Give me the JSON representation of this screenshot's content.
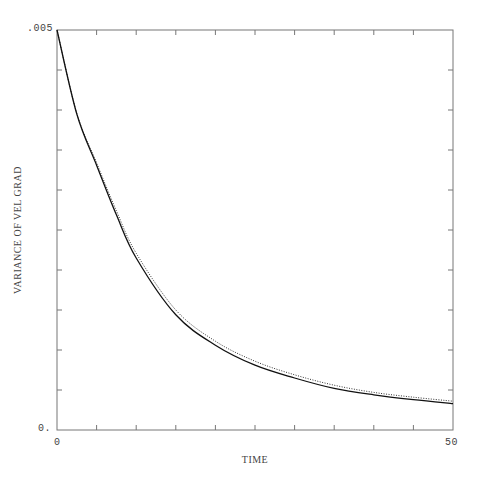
{
  "chart_data": {
    "type": "line",
    "title": "",
    "xlabel": "TIME",
    "ylabel": "VARIANCE OF VEL GRAD",
    "xlim": [
      0,
      50
    ],
    "ylim": [
      0,
      0.005
    ],
    "x_tick_labels": [
      "0",
      "50"
    ],
    "y_tick_labels": [
      ".005",
      "0."
    ],
    "x_minor_ticks": [
      5,
      10,
      15,
      20,
      25,
      30,
      35,
      40,
      45
    ],
    "y_minor_ticks": [
      0.0005,
      0.001,
      0.0015,
      0.002,
      0.0025,
      0.003,
      0.0035,
      0.004,
      0.0045
    ],
    "grid": false,
    "legend": null,
    "series": [
      {
        "name": "solid",
        "style": "solid",
        "x": [
          0,
          2.5,
          5,
          7.5,
          10,
          15,
          20,
          25,
          30,
          35,
          40,
          45,
          50
        ],
        "values": [
          0.005,
          0.00395,
          0.00331,
          0.00269,
          0.00215,
          0.00144,
          0.00106,
          0.00081,
          0.00065,
          0.00052,
          0.00044,
          0.00038,
          0.00033
        ]
      },
      {
        "name": "dotted",
        "style": "dotted",
        "x": [
          0,
          2.5,
          5,
          7.5,
          10,
          15,
          20,
          25,
          30,
          35,
          40,
          45,
          50
        ],
        "values": [
          0.005,
          0.00396,
          0.00334,
          0.00274,
          0.00221,
          0.0015,
          0.00111,
          0.00086,
          0.00069,
          0.00056,
          0.00047,
          0.00041,
          0.00036
        ]
      }
    ]
  },
  "labels": {
    "y_top": ".005",
    "y_bottom": "0.",
    "x_left": "0",
    "x_right": "50",
    "xlabel": "TIME",
    "ylabel": "VARIANCE OF VEL GRAD"
  }
}
